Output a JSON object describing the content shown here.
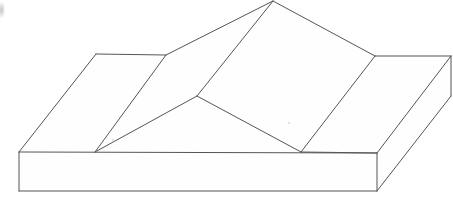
{
  "figure": {
    "background_color": "#ffffff",
    "line_color": "#555555",
    "fill_color": "#fefefe",
    "line_width": 1,
    "canvas": {
      "width": 453,
      "height": 204
    },
    "vertices": {
      "apex_top": [
        273,
        1
      ],
      "left_plateau_back": [
        96,
        54
      ],
      "left_ridge_junction": [
        166,
        55
      ],
      "center_y_junction": [
        197,
        96
      ],
      "left_slab_top": [
        95,
        152
      ],
      "slab_back_left": [
        19,
        152
      ],
      "slab_front_left_bottom": [
        19,
        191
      ],
      "center_face_bottom": [
        301,
        152
      ],
      "right_ridge_junction": [
        375,
        56
      ],
      "slab_back_right": [
        451,
        56
      ],
      "slab_front_right_top": [
        377,
        153
      ],
      "slab_front_right_bottom": [
        377,
        191
      ]
    },
    "faces": [
      {
        "name": "base-slab-front",
        "points": "19,152 377,153 377,191 19,191"
      },
      {
        "name": "base-slab-top-left",
        "points": "19,152 96,54 166,55 197,96 301,152"
      },
      {
        "name": "left-plateau",
        "points": "96,54 166,55 197,96 95,152"
      },
      {
        "name": "left-slope",
        "points": "166,55 273,1 197,96"
      },
      {
        "name": "center-slope",
        "points": "273,1 375,56 301,152 197,96"
      },
      {
        "name": "right-plateau",
        "points": "375,56 451,56 377,153 301,152"
      },
      {
        "name": "base-slab-right-end",
        "points": "377,153 451,56 451,96 377,191"
      }
    ],
    "edges": [
      {
        "name": "edge-slab-front-top",
        "x1": 19,
        "y1": 152,
        "x2": 377,
        "y2": 153
      },
      {
        "name": "edge-slab-front-bottom",
        "x1": 19,
        "y1": 191,
        "x2": 377,
        "y2": 191
      },
      {
        "name": "edge-slab-left-vertical",
        "x1": 19,
        "y1": 152,
        "x2": 19,
        "y2": 191
      },
      {
        "name": "edge-slab-right-vertical",
        "x1": 377,
        "y1": 153,
        "x2": 377,
        "y2": 191
      },
      {
        "name": "edge-slab-right-end-diagonal",
        "x1": 377,
        "y1": 191,
        "x2": 451,
        "y2": 96
      },
      {
        "name": "edge-slab-back-right-diagonal",
        "x1": 377,
        "y1": 153,
        "x2": 451,
        "y2": 56
      },
      {
        "name": "edge-slab-back-right-vertical",
        "x1": 451,
        "y1": 56,
        "x2": 451,
        "y2": 96
      },
      {
        "name": "edge-slab-top-back-left",
        "x1": 19,
        "y1": 152,
        "x2": 96,
        "y2": 54
      },
      {
        "name": "edge-plateau-left-top",
        "x1": 96,
        "y1": 54,
        "x2": 166,
        "y2": 55
      },
      {
        "name": "edge-plateau-left-front",
        "x1": 95,
        "y1": 152,
        "x2": 197,
        "y2": 96
      },
      {
        "name": "edge-plateau-left-fold",
        "x1": 95,
        "y1": 152,
        "x2": 166,
        "y2": 55
      },
      {
        "name": "edge-left-slope-up",
        "x1": 166,
        "y1": 55,
        "x2": 273,
        "y2": 1
      },
      {
        "name": "edge-ridge-left",
        "x1": 197,
        "y1": 96,
        "x2": 273,
        "y2": 1
      },
      {
        "name": "edge-center-valley",
        "x1": 197,
        "y1": 96,
        "x2": 301,
        "y2": 152
      },
      {
        "name": "edge-ridge-right",
        "x1": 273,
        "y1": 1,
        "x2": 375,
        "y2": 56
      },
      {
        "name": "edge-center-slope-right",
        "x1": 375,
        "y1": 56,
        "x2": 301,
        "y2": 152
      },
      {
        "name": "edge-plateau-right-top",
        "x1": 375,
        "y1": 56,
        "x2": 451,
        "y2": 56
      },
      {
        "name": "edge-plateau-right-front",
        "x1": 301,
        "y1": 152,
        "x2": 377,
        "y2": 153
      }
    ],
    "artifacts": [
      {
        "name": "scan-smudge-top-left",
        "left": 0,
        "top": 2
      },
      {
        "name": "scan-speck-center",
        "left": 112,
        "top": 139
      },
      {
        "name": "scan-speck-right",
        "left": 288,
        "top": 122
      }
    ]
  }
}
